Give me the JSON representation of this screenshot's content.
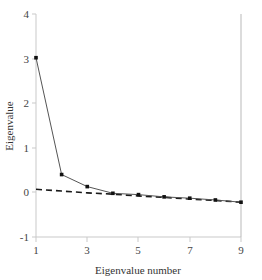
{
  "chart_data": {
    "type": "line",
    "title": "",
    "subtitle": "",
    "xlabel": "Eigenvalue number",
    "ylabel": "Eigenvalue",
    "x": [
      1,
      2,
      3,
      4,
      5,
      6,
      7,
      8,
      9
    ],
    "values": [
      3.02,
      0.4,
      0.13,
      -0.02,
      -0.05,
      -0.1,
      -0.13,
      -0.17,
      -0.22
    ],
    "series": [
      {
        "name": "observed-eigenvalues",
        "style": "solid-with-markers",
        "color": "#555555",
        "values": [
          3.02,
          0.4,
          0.13,
          -0.02,
          -0.05,
          -0.1,
          -0.13,
          -0.17,
          -0.22
        ]
      },
      {
        "name": "reference-trend",
        "style": "dashed",
        "color": "#1a1a1a",
        "values": [
          0.07,
          0.03,
          -0.01,
          -0.04,
          -0.08,
          -0.11,
          -0.15,
          -0.18,
          -0.22
        ]
      }
    ],
    "xlim": [
      1,
      9
    ],
    "ylim": [
      -1,
      4
    ],
    "xticks": [
      1,
      3,
      5,
      7,
      9
    ],
    "xtick_labels": [
      "1",
      "3",
      "5",
      "7",
      "9"
    ],
    "yticks": [
      -1,
      0,
      1,
      2,
      3,
      4
    ],
    "ytick_labels": [
      "-1",
      "0",
      "1",
      "2",
      "3",
      "4"
    ],
    "grid": false,
    "legend": "none",
    "vertical_marker_x": 9,
    "axis_color": "#c8c8c8",
    "background": "#ffffff"
  }
}
